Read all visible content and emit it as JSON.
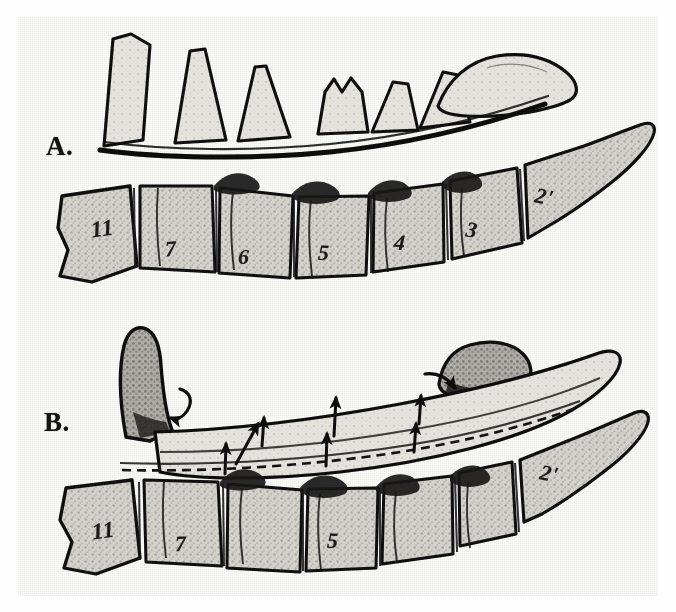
{
  "figure": {
    "background_color": "#fbfbfa",
    "ink_color": "#141414",
    "panels": [
      {
        "id": "A",
        "label": "A.",
        "description": "Normal alignment: spinous processes above, vertebral bodies below, numbered 11 through 2 prime",
        "vertebra_labels": [
          "11",
          "7",
          "6",
          "5",
          "4",
          "3",
          "2'"
        ]
      },
      {
        "id": "B",
        "label": "B.",
        "description": "Displaced / fractured alignment with arrows showing direction of movement, vertebral bodies numbered 11, 7, 5 and 2 prime",
        "vertebra_labels": [
          "11",
          "7",
          "5",
          "2'"
        ],
        "annotations": {
          "dashed_line": "dashed reference line along posterior vertebral margin",
          "arrows": [
            {
              "name": "curved-arrow-left",
              "direction": "down-left",
              "meaning": "displacement of detached fragment"
            },
            {
              "name": "straight-arrow-1",
              "direction": "up"
            },
            {
              "name": "straight-arrow-2",
              "direction": "up"
            },
            {
              "name": "straight-arrow-3",
              "direction": "up"
            },
            {
              "name": "straight-arrow-4",
              "direction": "up"
            },
            {
              "name": "straight-arrow-5",
              "direction": "up"
            },
            {
              "name": "straight-arrow-6",
              "direction": "up"
            },
            {
              "name": "curved-arrow-right",
              "direction": "down-right",
              "meaning": "displacement of upper fragment"
            }
          ]
        }
      }
    ],
    "panel_a_numbers": [
      {
        "text": "11",
        "x": 91,
        "y": 216,
        "rot": -8,
        "size": 23
      },
      {
        "text": "7",
        "x": 165,
        "y": 236,
        "rot": -4,
        "size": 22
      },
      {
        "text": "6",
        "x": 238,
        "y": 244,
        "rot": 0,
        "size": 22
      },
      {
        "text": "5",
        "x": 318,
        "y": 240,
        "rot": 2,
        "size": 22
      },
      {
        "text": "4",
        "x": 394,
        "y": 230,
        "rot": 4,
        "size": 22
      },
      {
        "text": "3",
        "x": 466,
        "y": 217,
        "rot": 8,
        "size": 22
      },
      {
        "text": "2'",
        "x": 535,
        "y": 184,
        "rot": 12,
        "size": 22
      }
    ],
    "panel_b_numbers": [
      {
        "text": "11",
        "x": 92,
        "y": 518,
        "rot": -8,
        "size": 23
      },
      {
        "text": "7",
        "x": 175,
        "y": 531,
        "rot": -2,
        "size": 22
      },
      {
        "text": "5",
        "x": 327,
        "y": 528,
        "rot": 2,
        "size": 22
      },
      {
        "text": "2'",
        "x": 540,
        "y": 461,
        "rot": 12,
        "size": 22
      }
    ]
  }
}
